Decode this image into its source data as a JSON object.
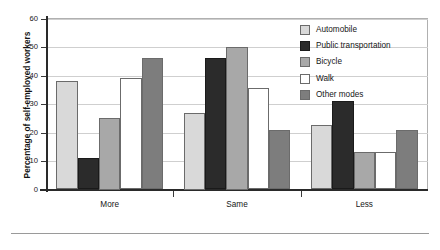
{
  "top_clipped_text": "",
  "chart_data": {
    "type": "bar",
    "title": "",
    "xlabel": "",
    "ylabel": "Percentage of self-employed workers",
    "ylim": [
      0,
      60
    ],
    "yticks": [
      0,
      10,
      20,
      30,
      40,
      50,
      60
    ],
    "ytick_labels": [
      "0",
      "10",
      "20",
      "30",
      "40",
      "50",
      "60"
    ],
    "grid": true,
    "legend_position": "upper right",
    "categories": [
      "More",
      "Same",
      "Less"
    ],
    "series": [
      {
        "name": "Automobile",
        "color": "#d9d9d9",
        "values": [
          38,
          27,
          22.5
        ]
      },
      {
        "name": "Public transportation",
        "color": "#2b2b2b",
        "values": [
          11,
          46,
          31
        ]
      },
      {
        "name": "Bicycle",
        "color": "#a8a8a8",
        "values": [
          25,
          50,
          13
        ]
      },
      {
        "name": "Walk",
        "color": "#ffffff",
        "values": [
          39,
          35.5,
          13
        ]
      },
      {
        "name": "Other modes",
        "color": "#7d7d7d",
        "values": [
          46,
          21,
          21
        ]
      }
    ]
  }
}
